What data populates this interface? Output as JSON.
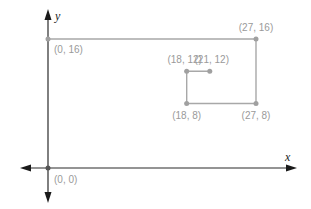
{
  "diagram": {
    "type": "coordinate-plane",
    "axes": {
      "x_label": "x",
      "y_label": "y"
    },
    "origin_label": "(0, 0)",
    "points": [
      {
        "id": "p0_16",
        "x": 0,
        "y": 16,
        "label": "(0, 16)"
      },
      {
        "id": "p27_16",
        "x": 27,
        "y": 16,
        "label": "(27, 16)"
      },
      {
        "id": "p27_8",
        "x": 27,
        "y": 8,
        "label": "(27, 8)"
      },
      {
        "id": "p18_8",
        "x": 18,
        "y": 8,
        "label": "(18, 8)"
      },
      {
        "id": "p18_12",
        "x": 18,
        "y": 12,
        "label": "(18, 12)"
      },
      {
        "id": "p21_12",
        "x": 21,
        "y": 12,
        "label": "(21, 12)"
      }
    ],
    "path": [
      [
        0,
        16
      ],
      [
        27,
        16
      ],
      [
        27,
        8
      ],
      [
        18,
        8
      ],
      [
        18,
        12
      ],
      [
        21,
        12
      ]
    ],
    "colors": {
      "axis": "#2b2b2b",
      "path": "#a8a8a8",
      "label": "#9a9a9a"
    }
  }
}
